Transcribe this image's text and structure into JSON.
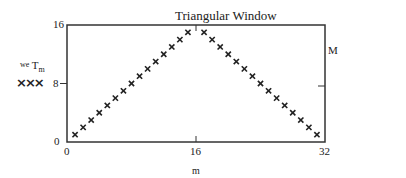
{
  "chart_data": {
    "type": "scatter",
    "title": "Triangular Window",
    "xlabel": "m",
    "ylabel": "we T_m",
    "legend_marker": "xxx",
    "right_axis_label": "M",
    "xlim": [
      0,
      32
    ],
    "ylim": [
      0,
      16
    ],
    "x_ticks": [
      "0",
      "16",
      "32"
    ],
    "y_ticks": [
      "0",
      "8",
      "16"
    ],
    "grid": false,
    "marker": "x",
    "marker_color": "#222222",
    "x": [
      1,
      2,
      3,
      4,
      5,
      6,
      7,
      8,
      9,
      10,
      11,
      12,
      13,
      14,
      15,
      16,
      17,
      18,
      19,
      20,
      21,
      22,
      23,
      24,
      25,
      26,
      27,
      28,
      29,
      30,
      31
    ],
    "values": [
      1,
      2,
      3,
      4,
      5,
      6,
      7,
      8,
      9,
      10,
      11,
      12,
      13,
      14,
      15,
      16,
      15,
      14,
      13,
      12,
      11,
      10,
      9,
      8,
      7,
      6,
      5,
      4,
      3,
      2,
      1
    ]
  },
  "labels": {
    "title": "Triangular Window",
    "ylabel_pre": "we",
    "ylabel_main": "T",
    "ylabel_sub": "m",
    "legend_marker": "×××",
    "right_label": "M",
    "xlabel": "m",
    "x_tick_0": "0",
    "x_tick_16": "16",
    "x_tick_32": "32",
    "y_tick_0": "0",
    "y_tick_8": "8",
    "y_tick_16": "16"
  }
}
